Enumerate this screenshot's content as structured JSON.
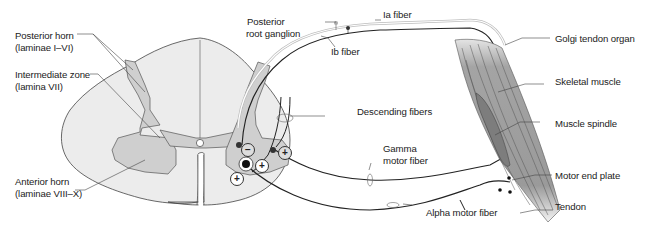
{
  "diagram": {
    "colors": {
      "background": "#ffffff",
      "white_matter": "#ececec",
      "gray_matter": "#cfcfcf",
      "muscle": "#9a9a9a",
      "spindle": "#7d7d7d",
      "line": "#333333",
      "fiber_dark": "#222222",
      "fiber_light": "#bdbdbd"
    },
    "labels": {
      "posterior_horn": {
        "line1": "Posterior horn",
        "line2": "(laminae I–VI)"
      },
      "intermediate_zone": {
        "line1": "Intermediate zone",
        "line2": "(lamina VII)"
      },
      "anterior_horn": {
        "line1": "Anterior horn",
        "line2": "(laminae VIII–X)"
      },
      "posterior_root_ganglion": {
        "line1": "Posterior",
        "line2": "root ganglion"
      },
      "ia_fiber": "Ia fiber",
      "ib_fiber": "Ib fiber",
      "descending_fibers": "Descending fibers",
      "gamma_motor_fiber": {
        "line1": "Gamma",
        "line2": "motor fiber"
      },
      "alpha_motor_fiber": "Alpha motor fiber",
      "golgi_tendon_organ": "Golgi tendon organ",
      "skeletal_muscle": "Skeletal muscle",
      "muscle_spindle": "Muscle spindle",
      "motor_end_plate": "Motor end plate",
      "tendon": "Tendon"
    },
    "synapse_signs": {
      "inhibitory": "−",
      "excitatory": "+"
    }
  }
}
